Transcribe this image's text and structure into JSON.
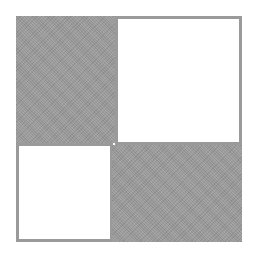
{
  "figure": {
    "colors": {
      "filled": "#9a9a9a",
      "empty": "#ffffff",
      "border": "#9a9a9a",
      "background": "#ffffff"
    },
    "cells": [
      {
        "position": "top-left",
        "state": "filled"
      },
      {
        "position": "top-right",
        "state": "empty"
      },
      {
        "position": "bottom-left",
        "state": "empty"
      },
      {
        "position": "bottom-right",
        "state": "filled"
      }
    ]
  }
}
